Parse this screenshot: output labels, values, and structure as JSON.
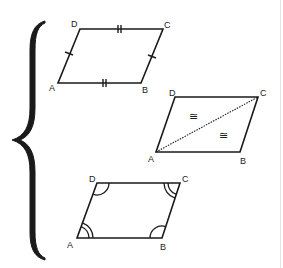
{
  "colors": {
    "stroke": "#1a1a1a",
    "brace": "#1a1a1a",
    "background": "#ffffff"
  },
  "brace": {
    "glyph": "left-curly-brace",
    "top_y": 20,
    "bottom_y": 260,
    "tip_x": 13,
    "tip_y": 140
  },
  "figures": [
    {
      "name": "opposite-sides-congruent",
      "vertices": {
        "A": "A",
        "B": "B",
        "C": "C",
        "D": "D"
      },
      "marks": "single tick on AD and BC; double tick on DC and AB"
    },
    {
      "name": "diagonal-congruent-triangles",
      "vertices": {
        "A": "A",
        "B": "B",
        "C": "C",
        "D": "D"
      },
      "diagonal": "AC (dotted)",
      "symbols": [
        "≅",
        "≅"
      ]
    },
    {
      "name": "opposite-angles-congruent",
      "vertices": {
        "A": "A",
        "B": "B",
        "C": "C",
        "D": "D"
      },
      "marks": "double arcs at A and C; single arcs at B and D"
    }
  ]
}
